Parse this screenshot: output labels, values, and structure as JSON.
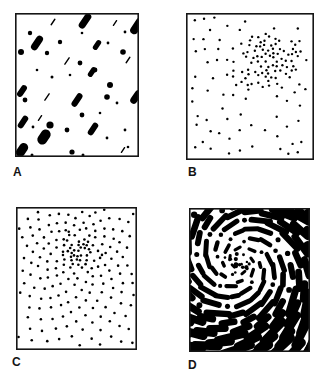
{
  "figure": {
    "background": "#ffffff",
    "ink": "#000000",
    "frame_color": "#161616"
  },
  "panels": [
    {
      "label": "A",
      "box": {
        "x": 15,
        "y": 13,
        "w": 124,
        "h": 144
      },
      "label_pos": {
        "x": 13,
        "y": 166
      },
      "pattern": {
        "type": "oriented-texture",
        "angle_deg": -56,
        "capsules": [
          [
            70,
            8,
            17,
            7
          ],
          [
            122,
            13,
            18,
            8
          ],
          [
            22,
            30,
            16,
            7
          ],
          [
            82,
            32,
            11,
            5
          ],
          [
            77,
            59,
            11,
            5
          ],
          [
            7,
            78,
            13,
            6
          ],
          [
            62,
            87,
            15,
            6
          ],
          [
            121,
            84,
            15,
            7
          ],
          [
            8,
            109,
            14,
            6
          ],
          [
            78,
            116,
            14,
            6
          ],
          [
            29,
            124,
            16,
            10
          ],
          [
            7,
            137,
            15,
            9
          ]
        ],
        "slashes": [
          [
            38,
            9,
            8
          ],
          [
            100,
            10,
            7
          ],
          [
            52,
            48,
            9
          ],
          [
            113,
            47,
            8
          ],
          [
            32,
            84,
            9
          ],
          [
            25,
            105,
            7
          ],
          [
            108,
            137,
            7
          ]
        ],
        "dots": [
          [
            35,
            112,
            3.6
          ],
          [
            95,
            72,
            3
          ],
          [
            108,
            39,
            2.8
          ],
          [
            6,
            39,
            3
          ],
          [
            92,
            84,
            2.8
          ],
          [
            15,
            20,
            2.2
          ],
          [
            45,
            29,
            2.2
          ],
          [
            65,
            50,
            2.4
          ],
          [
            10,
            87,
            2.4
          ],
          [
            67,
            102,
            2.4
          ],
          [
            52,
            117,
            2.4
          ],
          [
            57,
            139,
            2.6
          ],
          [
            80,
            57,
            2.4
          ],
          [
            32,
            40,
            2.2
          ],
          [
            110,
            19,
            1.4
          ],
          [
            67,
            20,
            1.3
          ],
          [
            93,
            30,
            1.4
          ],
          [
            22,
            57,
            1.3
          ],
          [
            37,
            64,
            1.5
          ],
          [
            55,
            62,
            1.3
          ],
          [
            102,
            90,
            1.4
          ],
          [
            85,
            100,
            1.3
          ],
          [
            18,
            114,
            1.4
          ],
          [
            92,
            125,
            1.4
          ],
          [
            110,
            117,
            1.4
          ],
          [
            17,
            142,
            1.5
          ],
          [
            68,
            142,
            1.5
          ],
          [
            113,
            134,
            1.3
          ]
        ]
      }
    },
    {
      "label": "B",
      "box": {
        "x": 186,
        "y": 13,
        "w": 128,
        "h": 147
      },
      "label_pos": {
        "x": 188,
        "y": 166
      },
      "pattern": {
        "type": "cluster-dots",
        "seed": 20,
        "dot_radius": 1.2,
        "background": {
          "count": 78,
          "min_dist": 8.5,
          "margin": 4
        },
        "cluster": {
          "cx": 84,
          "cy": 47,
          "sigma_x": 13.5,
          "sigma_y": 11.5,
          "count": 72,
          "min_dist": 3.6
        }
      }
    },
    {
      "label": "C",
      "box": {
        "x": 16,
        "y": 207,
        "w": 121,
        "h": 143
      },
      "label_pos": {
        "x": 12,
        "y": 356
      },
      "pattern": {
        "type": "spiral-dots",
        "seed": 5,
        "dot_radius": 1.3,
        "center": [
          62,
          44
        ],
        "core": {
          "count": 38,
          "sigma": 7.5,
          "min_dist": 3.2
        },
        "spiral": {
          "count": 400,
          "start": 6,
          "k": 1.25,
          "p": 0.76,
          "golden_angle_deg": 137.508,
          "phase": 0.6,
          "min_dist": 3.3,
          "jitter": 2.2
        }
      }
    },
    {
      "label": "D",
      "box": {
        "x": 189,
        "y": 208,
        "w": 121,
        "h": 144
      },
      "label_pos": {
        "x": 188,
        "y": 359
      },
      "pattern": {
        "type": "spiral-dashes",
        "seed": 9,
        "center": [
          51,
          55
        ],
        "core": {
          "count": 16,
          "sigma": 6.5
        },
        "spiral": {
          "count": 260,
          "start": 3,
          "k": 3.76,
          "p": 0.62,
          "golden_angle_deg": 137.508,
          "phase": 1.8,
          "pitch_deg": -20,
          "dot_prob": 0.2
        }
      }
    }
  ]
}
